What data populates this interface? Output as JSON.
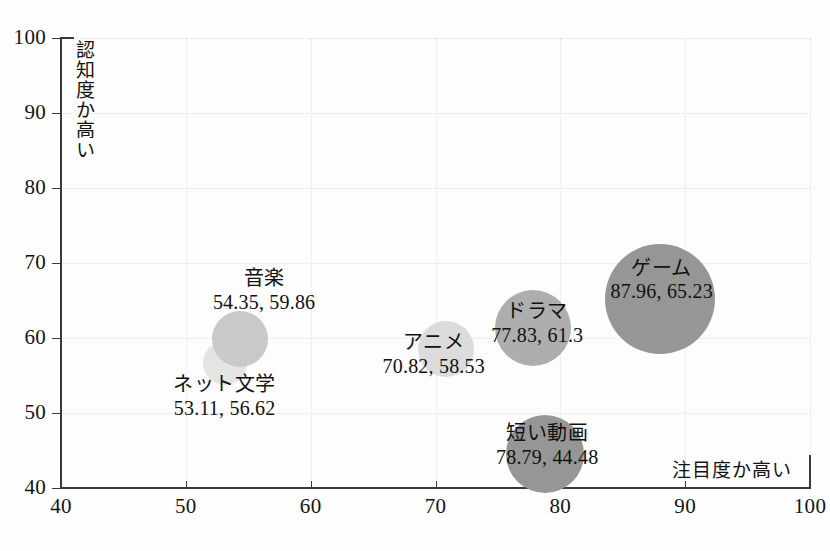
{
  "chart_data": {
    "type": "scatter",
    "subtype": "bubble",
    "title": "",
    "xlabel": "注目度か高い",
    "ylabel": "認知度か高い",
    "xlim": [
      40,
      100
    ],
    "ylim": [
      40,
      100
    ],
    "xticks": [
      40,
      50,
      60,
      70,
      80,
      90,
      100
    ],
    "yticks": [
      40,
      50,
      60,
      70,
      80,
      90,
      100
    ],
    "grid": true,
    "legend": "none",
    "points": [
      {
        "label": "ネット文学",
        "value_text": "53.11, 56.62",
        "x": 53.11,
        "y": 56.62,
        "size": 22,
        "color": "#e4e4e4",
        "label_dx": 0,
        "label_dy": 34
      },
      {
        "label": "音楽",
        "value_text": "54.35, 59.86",
        "x": 54.35,
        "y": 59.86,
        "size": 28,
        "color": "#c9c9c9",
        "label_dx": 24,
        "label_dy": -48
      },
      {
        "label": "アニメ",
        "value_text": "70.82, 58.53",
        "x": 70.82,
        "y": 58.53,
        "size": 28,
        "color": "#dcdcdc",
        "label_dx": -12,
        "label_dy": 6
      },
      {
        "label": "ドラマ",
        "value_text": "77.83, 61.3",
        "x": 77.83,
        "y": 61.3,
        "size": 38,
        "color": "#aeaeae",
        "label_dx": 4,
        "label_dy": -4
      },
      {
        "label": "ゲーム",
        "value_text": "87.96, 65.23",
        "x": 87.96,
        "y": 65.23,
        "size": 55,
        "color": "#969696",
        "label_dx": 2,
        "label_dy": -18
      },
      {
        "label": "短い動画",
        "value_text": "78.79, 44.48",
        "x": 78.79,
        "y": 44.48,
        "size": 39,
        "color": "#969696",
        "label_dx": 2,
        "label_dy": -8
      }
    ]
  },
  "colors": {
    "axis": "#3a3a3a",
    "grid": "#e2e2e2",
    "text": "#141414",
    "background": "#fdfdfd"
  }
}
